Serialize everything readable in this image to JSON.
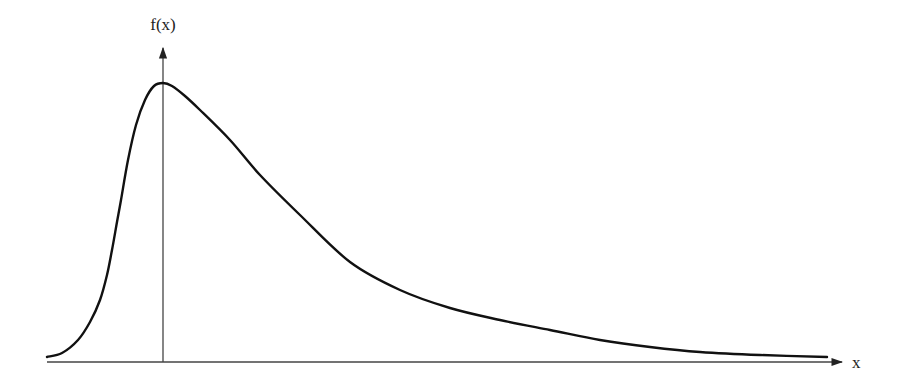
{
  "chart_data": {
    "type": "line",
    "title": "",
    "xlabel": "x",
    "ylabel": "f(x)",
    "grid": false,
    "legend": null,
    "axes": {
      "x_axis": {
        "label": "x",
        "has_arrow": true,
        "ticks": []
      },
      "y_axis": {
        "label": "f(x)",
        "has_arrow": true,
        "ticks": [],
        "position_note": "vertical axis passes through the peak (mode) of the curve"
      }
    },
    "series": [
      {
        "name": "f(x)",
        "color": "#111111",
        "pixel_points": [
          [
            47,
            357
          ],
          [
            62,
            353
          ],
          [
            78,
            340
          ],
          [
            90,
            322
          ],
          [
            100,
            300
          ],
          [
            107,
            275
          ],
          [
            112,
            250
          ],
          [
            117,
            222
          ],
          [
            121,
            200
          ],
          [
            128,
            160
          ],
          [
            136,
            125
          ],
          [
            145,
            100
          ],
          [
            154,
            86
          ],
          [
            163,
            83
          ],
          [
            172,
            86
          ],
          [
            185,
            96
          ],
          [
            200,
            110
          ],
          [
            230,
            140
          ],
          [
            260,
            175
          ],
          [
            300,
            215
          ],
          [
            350,
            262
          ],
          [
            400,
            290
          ],
          [
            450,
            308
          ],
          [
            500,
            320
          ],
          [
            550,
            330
          ],
          [
            600,
            340
          ],
          [
            650,
            347
          ],
          [
            700,
            352
          ],
          [
            760,
            355
          ],
          [
            827,
            357
          ]
        ]
      }
    ],
    "annotations": []
  },
  "labels": {
    "y_axis": "f(x)",
    "x_axis": "x"
  },
  "colors": {
    "curve": "#111111",
    "axis": "#333333",
    "background": "#ffffff"
  }
}
